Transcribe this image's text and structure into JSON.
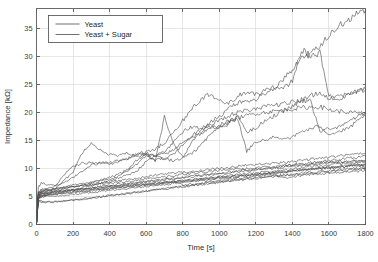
{
  "chart_data": {
    "type": "line",
    "title": "",
    "xlabel": "Time [s]",
    "ylabel": "Impedance [kΩ]",
    "xlim": [
      0,
      1800
    ],
    "ylim": [
      0,
      38.5
    ],
    "xticks": [
      0,
      200,
      400,
      600,
      800,
      1000,
      1200,
      1400,
      1600,
      1800
    ],
    "yticks": [
      0,
      5,
      10,
      15,
      20,
      25,
      30,
      35
    ],
    "grid": true,
    "legend_position": "upper-left",
    "legend": [
      "Yeast",
      "Yeast + Sugar"
    ],
    "line_color": "#4d4d4d",
    "x": [
      0,
      10,
      25,
      50,
      100,
      150,
      200,
      250,
      300,
      350,
      400,
      450,
      500,
      550,
      600,
      650,
      700,
      750,
      800,
      850,
      900,
      950,
      1000,
      1050,
      1100,
      1150,
      1200,
      1250,
      1300,
      1350,
      1400,
      1450,
      1500,
      1550,
      1600,
      1650,
      1700,
      1750,
      1800
    ],
    "series": [
      {
        "name": "Yeast + Sugar run 1",
        "group": "Yeast + Sugar",
        "values": [
          0.2,
          6.6,
          7.4,
          7.2,
          7.0,
          7.4,
          8.4,
          9.6,
          10.6,
          11.0,
          11.1,
          11.3,
          11.8,
          12.6,
          12.9,
          13.4,
          14.6,
          16.4,
          18.5,
          20.6,
          22.4,
          23.2,
          22.1,
          21.5,
          22.8,
          23.6,
          23.1,
          23.9,
          24.5,
          25.8,
          27.6,
          29.6,
          30.4,
          31.8,
          33.5,
          35.2,
          36.4,
          37.4,
          38.3
        ]
      },
      {
        "name": "Yeast + Sugar run 2",
        "group": "Yeast + Sugar",
        "values": [
          0.2,
          5.6,
          6.2,
          6.4,
          6.8,
          8.8,
          10.3,
          11.0,
          11.0,
          10.9,
          10.8,
          11.2,
          11.8,
          12.6,
          12.4,
          12.2,
          13.0,
          14.6,
          16.6,
          17.4,
          17.0,
          18.2,
          19.2,
          20.6,
          21.6,
          22.0,
          22.4,
          23.3,
          24.3,
          24.2,
          25.6,
          31.2,
          30.0,
          30.6,
          22.8,
          22.3,
          23.0,
          23.6,
          24.1
        ]
      },
      {
        "name": "Yeast + Sugar run 3",
        "group": "Yeast + Sugar",
        "values": [
          0.2,
          5.0,
          5.6,
          5.8,
          6.4,
          7.8,
          9.4,
          12.8,
          14.7,
          13.2,
          12.5,
          12.2,
          12.8,
          12.0,
          12.8,
          12.2,
          11.6,
          11.4,
          11.9,
          14.6,
          16.5,
          17.6,
          17.2,
          17.9,
          19.5,
          16.5,
          17.1,
          18.6,
          19.4,
          20.2,
          21.0,
          22.2,
          23.0,
          23.5,
          22.6,
          22.9,
          23.3,
          23.7,
          24.0
        ]
      },
      {
        "name": "Yeast + Sugar run 4",
        "group": "Yeast + Sugar",
        "values": [
          0.2,
          4.8,
          5.2,
          5.4,
          5.8,
          6.4,
          6.8,
          7.0,
          7.4,
          7.8,
          8.0,
          8.6,
          9.6,
          11.5,
          12.6,
          11.4,
          19.2,
          14.2,
          12.0,
          12.6,
          14.2,
          16.0,
          17.4,
          18.2,
          18.8,
          13.0,
          14.8,
          15.0,
          15.6,
          15.4,
          15.5,
          16.6,
          17.0,
          17.6,
          16.1,
          16.5,
          17.0,
          18.2,
          19.5
        ]
      },
      {
        "name": "Yeast + Sugar run 5",
        "group": "Yeast + Sugar",
        "values": [
          0.2,
          5.2,
          5.8,
          6.0,
          6.2,
          6.6,
          7.0,
          7.2,
          7.6,
          8.0,
          8.4,
          9.0,
          9.8,
          10.8,
          12.2,
          11.6,
          11.9,
          12.4,
          14.2,
          15.8,
          17.0,
          17.8,
          18.6,
          19.4,
          19.9,
          20.4,
          20.7,
          21.0,
          21.3,
          21.6,
          21.8,
          22.0,
          22.1,
          16.5,
          17.0,
          17.2,
          18.4,
          19.2,
          19.9
        ]
      },
      {
        "name": "Yeast + Sugar run 6",
        "group": "Yeast + Sugar",
        "values": [
          0.2,
          4.6,
          5.0,
          5.2,
          5.4,
          5.8,
          6.2,
          6.6,
          7.0,
          7.4,
          7.8,
          8.3,
          8.8,
          9.6,
          11.2,
          12.2,
          12.6,
          13.2,
          14.8,
          15.6,
          16.2,
          17.0,
          17.8,
          18.4,
          19.0,
          19.4,
          19.8,
          20.0,
          20.2,
          20.4,
          20.6,
          20.8,
          20.9,
          21.0,
          20.5,
          20.2,
          20.0,
          19.9,
          19.8
        ]
      },
      {
        "name": "Yeast run 1",
        "group": "Yeast",
        "values": [
          0.2,
          5.4,
          5.8,
          6.2,
          6.4,
          6.6,
          6.8,
          7.0,
          7.2,
          7.4,
          7.6,
          7.8,
          8.0,
          8.2,
          8.5,
          8.8,
          9.0,
          9.2,
          9.3,
          9.5,
          9.6,
          9.8,
          10.0,
          10.2,
          10.4,
          10.6,
          10.7,
          10.8,
          10.9,
          11.0,
          11.2,
          11.4,
          11.6,
          11.8,
          12.0,
          12.2,
          12.4,
          12.5,
          12.6
        ]
      },
      {
        "name": "Yeast run 2",
        "group": "Yeast",
        "values": [
          0.2,
          5.8,
          6.0,
          6.2,
          6.4,
          6.5,
          6.7,
          6.9,
          7.0,
          7.2,
          7.4,
          7.5,
          7.7,
          7.9,
          8.1,
          8.3,
          8.5,
          8.7,
          8.9,
          9.1,
          9.3,
          9.5,
          9.6,
          9.8,
          9.9,
          10.0,
          10.1,
          10.2,
          10.3,
          10.5,
          10.6,
          10.8,
          11.0,
          11.2,
          11.4,
          11.6,
          11.8,
          12.0,
          12.1
        ]
      },
      {
        "name": "Yeast run 3",
        "group": "Yeast",
        "values": [
          0.2,
          5.0,
          5.4,
          5.6,
          5.8,
          6.0,
          6.2,
          6.4,
          6.6,
          6.8,
          7.0,
          7.2,
          7.4,
          7.5,
          7.7,
          7.9,
          8.1,
          8.2,
          8.4,
          8.6,
          8.8,
          9.0,
          9.2,
          9.4,
          9.6,
          9.8,
          9.9,
          10.0,
          10.2,
          10.4,
          10.6,
          10.7,
          10.8,
          11.0,
          11.1,
          11.2,
          11.3,
          11.4,
          11.4
        ]
      },
      {
        "name": "Yeast run 4",
        "group": "Yeast",
        "values": [
          0.2,
          5.2,
          5.4,
          5.6,
          5.8,
          5.9,
          6.1,
          6.3,
          6.5,
          6.7,
          6.9,
          7.0,
          7.2,
          7.4,
          7.6,
          7.8,
          8.0,
          8.1,
          8.3,
          8.5,
          8.7,
          8.9,
          9.0,
          9.2,
          9.4,
          9.5,
          9.7,
          9.9,
          10.0,
          10.2,
          10.4,
          10.5,
          10.7,
          10.8,
          11.0,
          11.1,
          11.2,
          11.3,
          11.3
        ]
      },
      {
        "name": "Yeast run 5",
        "group": "Yeast",
        "values": [
          0.2,
          4.8,
          5.0,
          5.2,
          5.4,
          5.5,
          5.7,
          5.9,
          6.0,
          6.2,
          6.4,
          6.5,
          6.7,
          6.9,
          7.1,
          7.3,
          7.4,
          7.6,
          7.8,
          8.0,
          8.2,
          8.4,
          8.5,
          8.7,
          8.9,
          9.1,
          9.2,
          9.4,
          9.6,
          9.8,
          9.9,
          10.1,
          10.3,
          10.4,
          10.6,
          10.8,
          10.9,
          11.0,
          11.1
        ]
      },
      {
        "name": "Yeast run 6",
        "group": "Yeast",
        "values": [
          0.2,
          4.6,
          4.8,
          5.0,
          5.1,
          5.2,
          5.4,
          5.5,
          5.7,
          5.9,
          6.0,
          6.2,
          6.4,
          6.6,
          6.8,
          6.9,
          7.1,
          7.3,
          7.5,
          7.6,
          7.8,
          8.0,
          8.2,
          8.3,
          8.5,
          8.7,
          8.8,
          9.0,
          9.2,
          9.3,
          9.5,
          9.7,
          9.8,
          10.0,
          10.1,
          10.3,
          10.4,
          10.5,
          10.6
        ]
      },
      {
        "name": "Yeast run 7",
        "group": "Yeast",
        "values": [
          0.2,
          5.0,
          5.2,
          5.3,
          5.5,
          5.6,
          5.8,
          5.9,
          6.1,
          6.2,
          6.4,
          6.6,
          6.7,
          6.9,
          7.0,
          7.2,
          7.4,
          7.5,
          7.7,
          7.8,
          8.0,
          8.2,
          8.3,
          8.5,
          8.6,
          8.8,
          8.9,
          9.1,
          9.2,
          9.4,
          9.5,
          9.7,
          9.8,
          10.0,
          10.1,
          10.2,
          10.4,
          10.5,
          10.6
        ]
      },
      {
        "name": "Yeast run 8",
        "group": "Yeast",
        "values": [
          0.2,
          4.4,
          4.2,
          4.0,
          4.1,
          4.2,
          4.3,
          4.5,
          4.7,
          4.9,
          5.1,
          5.3,
          5.5,
          5.7,
          5.9,
          6.1,
          6.3,
          6.5,
          6.7,
          6.9,
          7.1,
          7.3,
          7.5,
          7.7,
          7.9,
          8.0,
          8.2,
          8.4,
          8.5,
          8.7,
          8.8,
          9.0,
          9.1,
          9.3,
          9.4,
          9.6,
          9.7,
          9.8,
          9.9
        ]
      },
      {
        "name": "Yeast run 9",
        "group": "Yeast",
        "values": [
          0.2,
          5.6,
          5.8,
          5.9,
          6.0,
          6.1,
          6.2,
          6.3,
          6.4,
          6.6,
          6.7,
          6.9,
          7.0,
          7.2,
          7.3,
          7.5,
          7.6,
          7.8,
          7.0,
          7.2,
          7.4,
          7.6,
          7.8,
          8.0,
          8.2,
          8.4,
          8.6,
          8.8,
          9.0,
          8.3,
          8.5,
          8.7,
          8.9,
          9.0,
          9.2,
          9.3,
          9.4,
          9.5,
          9.6
        ]
      },
      {
        "name": "Yeast run 10",
        "group": "Yeast",
        "values": [
          0.2,
          5.2,
          5.5,
          5.7,
          5.8,
          5.9,
          6.0,
          6.1,
          6.3,
          6.4,
          6.6,
          6.7,
          6.9,
          7.0,
          7.2,
          7.3,
          7.5,
          7.6,
          7.8,
          7.9,
          8.1,
          8.2,
          8.4,
          8.5,
          8.7,
          8.8,
          9.0,
          9.1,
          9.3,
          9.4,
          9.6,
          9.7,
          9.9,
          10.0,
          10.2,
          10.3,
          10.5,
          10.6,
          10.7
        ]
      },
      {
        "name": "Yeast run 11",
        "group": "Yeast",
        "values": [
          0.2,
          4.2,
          4.0,
          3.9,
          4.0,
          4.2,
          4.4,
          4.6,
          4.8,
          5.0,
          5.2,
          5.4,
          5.6,
          5.8,
          6.0,
          6.2,
          6.4,
          6.6,
          6.8,
          7.0,
          7.2,
          7.4,
          7.6,
          7.8,
          8.0,
          8.2,
          8.3,
          8.5,
          8.7,
          8.8,
          9.0,
          9.1,
          9.3,
          9.4,
          9.6,
          9.7,
          9.9,
          10.0,
          10.1
        ]
      }
    ]
  }
}
